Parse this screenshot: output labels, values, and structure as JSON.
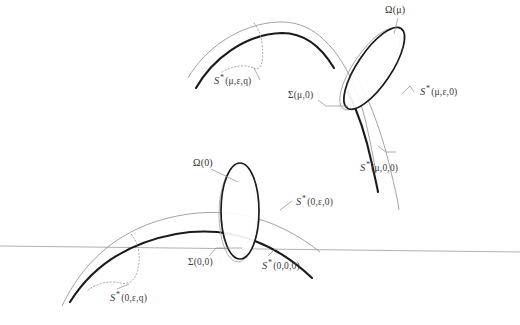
{
  "figure": {
    "colors": {
      "thick_curve": "#1a1a1a",
      "thin_curve": "#8c8c8c",
      "dotted_curve": "#9a9a9a",
      "leader_line": "#8c8c8c",
      "horizontal_axis": "#9a9a9a",
      "ellipse_outline": "#1a1a1a",
      "ellipse_shadow": "#a8a8a8",
      "label_text": "#3a3a3a",
      "background": "#ffffff"
    }
  },
  "upper_panel": {
    "labels": {
      "omega_mu": "Ω(μ)",
      "sigma_mu_0": "Σ(μ,0)",
      "s_mu_eps_q": {
        "symbol": "S",
        "star": "*",
        "args": "(μ,ε,q)"
      },
      "s_mu_eps_0": {
        "symbol": "S",
        "star": "*",
        "args": "(μ,ε,0)"
      },
      "s_mu_0_0": {
        "symbol": "S",
        "star": "*",
        "args": "(μ,0,0)"
      }
    }
  },
  "lower_panel": {
    "labels": {
      "omega_0": "Ω(0)",
      "sigma_0_0": "Σ(0,0)",
      "s_0_eps_q": {
        "symbol": "S",
        "star": "*",
        "args": "(0,ε,q)"
      },
      "s_0_eps_0": {
        "symbol": "S",
        "star": "*",
        "args": "(0,ε,0)"
      },
      "s_0_0_0": {
        "symbol": "S",
        "star": "*",
        "args": "(0,0,0)"
      }
    }
  }
}
